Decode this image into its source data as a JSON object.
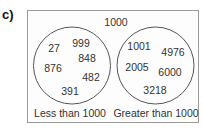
{
  "figure": {
    "part_label": "c)",
    "universal_set_label": "1000",
    "sets": [
      {
        "name": "Less than 1000",
        "members": [
          "27",
          "999",
          "876",
          "848",
          "482",
          "391"
        ]
      },
      {
        "name": "Greater than 1000",
        "members": [
          "1001",
          "4976",
          "2005",
          "6000",
          "3218"
        ]
      }
    ]
  },
  "colors": {
    "box_border": "#9a9a9a",
    "circle_stroke": "#555555",
    "text": "#333333"
  }
}
